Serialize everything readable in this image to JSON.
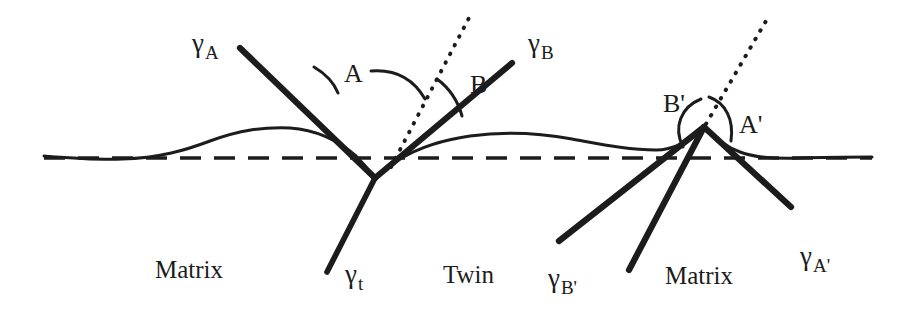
{
  "figure": {
    "domain_note": "schematic of thermal-groove / twin boundary surface profile",
    "background_color": "#ffffff",
    "ink_color": "#1c1c1c",
    "width": 914,
    "height": 315
  },
  "labels": {
    "gamma_A": {
      "symbol": "γ",
      "sub": "A",
      "x": 192,
      "y": 52
    },
    "gamma_B": {
      "symbol": "γ",
      "sub": "B",
      "x": 528,
      "y": 52
    },
    "gamma_t": {
      "symbol": "γ",
      "sub": "t",
      "x": 345,
      "y": 283
    },
    "gamma_Bp": {
      "symbol": "γ",
      "sub": "B'",
      "x": 548,
      "y": 287
    },
    "gamma_Ap": {
      "symbol": "γ",
      "sub": "A'",
      "x": 800,
      "y": 265
    },
    "angle_A": {
      "text": "A",
      "x": 344,
      "y": 82
    },
    "angle_B": {
      "text": "B",
      "x": 470,
      "y": 93
    },
    "angle_Ap": {
      "text": "A'",
      "x": 739,
      "y": 133
    },
    "angle_Bp": {
      "text": "B'",
      "x": 663,
      "y": 112
    },
    "region_matrix_left": {
      "text": "Matrix",
      "x": 155,
      "y": 278
    },
    "region_twin": {
      "text": "Twin",
      "x": 443,
      "y": 283
    },
    "region_matrix_right": {
      "text": "Matrix",
      "x": 665,
      "y": 284
    }
  },
  "geometry": {
    "baseline": {
      "y": 158,
      "x_start": 42,
      "x_end": 872,
      "style": "dashed"
    },
    "left_junction": {
      "x": 375,
      "y": 178
    },
    "right_junction": {
      "x": 704,
      "y": 127
    },
    "surface_profile_left": "M 44,156 C 70,158 95,160 122,159 C 160,158 186,150 210,141 C 240,130 262,127 290,128 C 318,130 340,142 356,156 C 366,166 371,173 375,178",
    "surface_profile_right": "M 375,178 C 382,172 390,165 400,159 C 420,147 442,140 470,136 C 505,131 540,133 572,139 C 600,144 628,150 656,150 C 672,150 690,142 704,127",
    "surface_profile_far_right": "M 704,127 C 714,137 726,147 740,152 C 756,158 776,159 800,158 C 828,157 852,157 872,157",
    "gamma_A_line": {
      "x1": 240,
      "y1": 48,
      "x2": 375,
      "y2": 178
    },
    "gamma_B_line": {
      "x1": 512,
      "y1": 63,
      "x2": 375,
      "y2": 178
    },
    "gamma_t_line": {
      "x1": 375,
      "y1": 178,
      "x2": 327,
      "y2": 272
    },
    "gamma_Ap_line": {
      "x1": 704,
      "y1": 127,
      "x2": 791,
      "y2": 207
    },
    "gamma_Bp_line": {
      "x1": 704,
      "y1": 127,
      "x2": 559,
      "y2": 241
    },
    "twin_boundary_right": {
      "x1": 704,
      "y1": 127,
      "x2": 629,
      "y2": 270
    },
    "dotted_normal_left": {
      "x1": 391,
      "y1": 167,
      "x2": 470,
      "y2": 16
    },
    "dotted_normal_right": {
      "x1": 706,
      "y1": 124,
      "x2": 766,
      "y2": 21
    },
    "arc_A_inner": "M 314,67 C 326,74 334,83 338,93",
    "arc_A_outer": "M 371,71 C 396,69 414,80 425,99",
    "arc_B": "M 437,79 C 449,88 458,101 462,116",
    "arc_Bp": "M 683,147 C 675,128 682,108 700,100",
    "arc_Ap": "M 709,98 C 725,104 733,120 731,140"
  }
}
